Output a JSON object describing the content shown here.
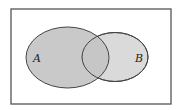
{
  "diagram": {
    "type": "venn",
    "sets": [
      {
        "label": "A",
        "fill": "#c4c4c4"
      },
      {
        "label": "B",
        "fill": "#dadada"
      }
    ],
    "colors": {
      "background": "#ffffff",
      "frame": "#555555",
      "outline": "#444444",
      "overlap": "#cfcfcf"
    }
  }
}
